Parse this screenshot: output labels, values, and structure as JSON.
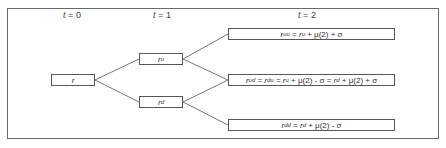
{
  "diagram": {
    "type": "binomial-interest-rate-tree",
    "time_labels": [
      {
        "var": "t",
        "eq": " = ",
        "value": "0"
      },
      {
        "var": "t",
        "eq": " = ",
        "value": "1"
      },
      {
        "var": "t",
        "eq": " = ",
        "value": "2"
      }
    ],
    "nodes": {
      "root": {
        "base": "r",
        "sup": ""
      },
      "up": {
        "base": "r",
        "sup": "u"
      },
      "down": {
        "base": "r",
        "sup": "d"
      },
      "uu": {
        "text": "r^uu = r^u + μ(2) + σ",
        "parts": [
          {
            "base": "r",
            "sup": "uu"
          },
          {
            "text": " = "
          },
          {
            "base": "r",
            "sup": "u"
          },
          {
            "text": " + μ(2) + σ"
          }
        ]
      },
      "ud": {
        "text": "r^ud = r^du = r^u + μ(2) - σ = r^d + μ(2) + σ",
        "parts": [
          {
            "base": "r",
            "sup": "ud"
          },
          {
            "text": " = "
          },
          {
            "base": "r",
            "sup": "du"
          },
          {
            "text": " = "
          },
          {
            "base": "r",
            "sup": "u"
          },
          {
            "text": " + μ(2) - σ = "
          },
          {
            "base": "r",
            "sup": "d"
          },
          {
            "text": " + μ(2) + σ"
          }
        ]
      },
      "dd": {
        "text": "r^dd = r^d + μ(2) - σ",
        "parts": [
          {
            "base": "r",
            "sup": "dd"
          },
          {
            "text": " = "
          },
          {
            "base": "r",
            "sup": "d"
          },
          {
            "text": " + μ(2) - σ"
          }
        ]
      }
    },
    "edges": [
      [
        "root",
        "up"
      ],
      [
        "root",
        "down"
      ],
      [
        "up",
        "uu"
      ],
      [
        "up",
        "ud"
      ],
      [
        "down",
        "ud"
      ],
      [
        "down",
        "dd"
      ]
    ],
    "colors": {
      "border": "#555555",
      "frame": "#6a6a6a",
      "text": "#333333",
      "edge": "#777777"
    }
  }
}
